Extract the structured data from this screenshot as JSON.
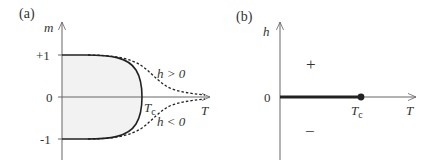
{
  "panel_a": {
    "label": "(a)",
    "y_axis_label": "m",
    "x_axis_label": "T",
    "tick_plus_one": "+1",
    "tick_zero": "0",
    "tick_minus_one": "-1",
    "critical_label": "T",
    "critical_sub": "c",
    "upper_curve_label": "h > 0",
    "lower_curve_label": "h < 0"
  },
  "panel_b": {
    "label": "(b)",
    "y_axis_label": "h",
    "x_axis_label": "T",
    "tick_zero": "0",
    "critical_label": "T",
    "critical_sub": "c",
    "region_plus": "+",
    "region_minus": "−"
  },
  "colors": {
    "ink": "#333333",
    "axis": "#666666",
    "fill": "#f2f2f2"
  }
}
